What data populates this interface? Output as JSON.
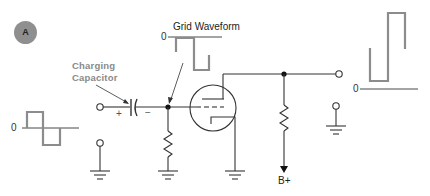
{
  "figure": {
    "badge": "A",
    "labels": {
      "charging_capacitor_line1": "Charging",
      "charging_capacitor_line2": "Capacitor",
      "grid_waveform": "Grid Waveform",
      "b_plus": "B+",
      "plus_sign": "+",
      "minus_sign": "−",
      "zero_input": "0",
      "zero_grid": "0",
      "zero_output": "0"
    },
    "colors": {
      "wire": "#333333",
      "waveform": "#8c8c8c",
      "badge": "#8f8f8f",
      "label_gray": "#8a8a8a"
    },
    "components": [
      "input terminal",
      "coupling capacitor",
      "grid resistor",
      "triode tube",
      "plate load resistor",
      "output terminal",
      "ground symbols"
    ],
    "waveforms": {
      "input": "square wave centered on zero",
      "grid": "clamped square wave below zero",
      "output": "inverted amplified square wave above zero"
    }
  }
}
